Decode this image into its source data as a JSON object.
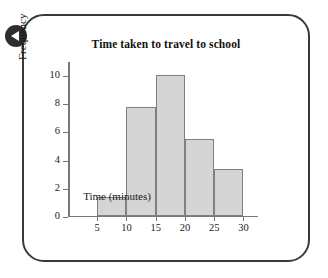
{
  "frame": {
    "badge_icon": "back-triangle-icon"
  },
  "chart_data": {
    "type": "bar",
    "title": "Time taken to travel to school",
    "xlabel": "Time (minutes)",
    "ylabel": "Frequency",
    "grid": false,
    "legend": null,
    "xlim": [
      0,
      32.5
    ],
    "ylim": [
      0,
      11
    ],
    "xticks": [
      5,
      10,
      15,
      20,
      25,
      30
    ],
    "yticks": [
      0,
      2,
      4,
      6,
      8,
      10
    ],
    "xtick_labels": [
      "5",
      "10",
      "15",
      "20",
      "25",
      "30"
    ],
    "ytick_labels": [
      "0",
      "2",
      "4",
      "6",
      "8",
      "10"
    ],
    "bin_width": 5,
    "bin_edges": [
      5,
      10,
      15,
      20,
      25,
      30
    ],
    "categories": [
      "5-10",
      "10-15",
      "15-20",
      "20-25",
      "25-30"
    ],
    "values": [
      1.3,
      7.7,
      10.0,
      5.4,
      3.3
    ],
    "bar_color": "#d5d5d5",
    "bar_edge_color": "#808080",
    "axis_color": "#777777"
  }
}
